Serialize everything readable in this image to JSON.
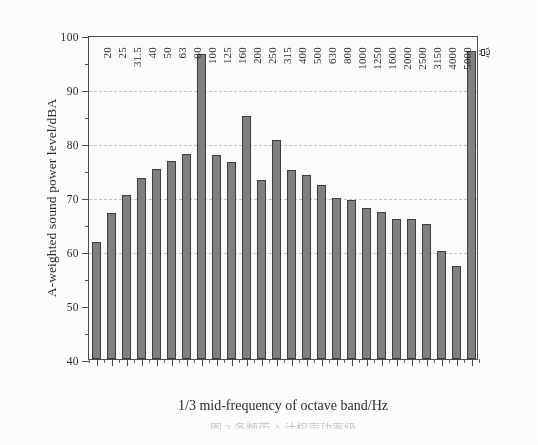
{
  "chart_data": {
    "type": "bar",
    "title": "",
    "xlabel": "1/3 mid-frequency of octave band/Hz",
    "ylabel": "A-weighted sound power level/dBA",
    "ylim": [
      40,
      100
    ],
    "ytick_step": 10,
    "yminor_step": 5,
    "grid": "horizontal-dashed",
    "legend": "none",
    "bar_color": "#808080",
    "bar_edge_color": "#3d3d3d",
    "axis_color": "#4a4a4a",
    "categories": [
      "20",
      "25",
      "31.5",
      "40",
      "50",
      "63",
      "80",
      "100",
      "125",
      "160",
      "200",
      "250",
      "315",
      "400",
      "500",
      "630",
      "800",
      "1000",
      "1250",
      "1600",
      "2000",
      "2500",
      "3150",
      "4000",
      "5000",
      "总"
    ],
    "values": [
      61.7,
      67.0,
      70.4,
      73.6,
      75.1,
      76.6,
      78.0,
      96.5,
      77.8,
      76.4,
      85.0,
      73.1,
      80.5,
      75.0,
      74.0,
      72.3,
      69.8,
      69.4,
      68.0,
      67.2,
      66.0,
      66.0,
      65.0,
      60.0,
      57.3,
      97.0
    ],
    "ytick_labels": [
      "100",
      "90",
      "80",
      "70",
      "60",
      "50",
      "40"
    ],
    "ytick_values": [
      100,
      90,
      80,
      70,
      60,
      50,
      40
    ],
    "gridline_values": [
      90,
      80,
      70,
      60
    ],
    "annotations": [],
    "caption": "图 3  各频带 A 计权声功率级"
  }
}
